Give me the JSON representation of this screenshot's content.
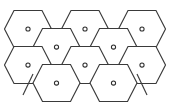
{
  "figure": {
    "background_color": "#ffffff",
    "line_color": "#3a3a3a",
    "node_color": "#2e2e2e",
    "width": 169,
    "height": 102
  },
  "lattice": {
    "cell_shape": "hexagon",
    "orientation": "pointy-side-horizontal",
    "hex_half_width": 23.5,
    "hex_half_height": 18.5,
    "hex_slant": 9.5,
    "row_count": 4,
    "rows": [
      {
        "row_index": 0,
        "offset": "aligned",
        "center_y": 29,
        "cells": [
          {
            "id": "r0c0",
            "cx": 28,
            "cy": 29,
            "marker": "o"
          },
          {
            "id": "r0c1",
            "cx": 85,
            "cy": 29,
            "marker": "o"
          },
          {
            "id": "r0c2",
            "cx": 142,
            "cy": 29,
            "marker": "o"
          }
        ]
      },
      {
        "row_index": 1,
        "offset": "staggered",
        "center_y": 47,
        "cells": [
          {
            "id": "r1c0",
            "cx": 56.5,
            "cy": 47,
            "marker": "o"
          },
          {
            "id": "r1c1",
            "cx": 113.5,
            "cy": 47,
            "marker": "o"
          }
        ]
      },
      {
        "row_index": 2,
        "offset": "aligned",
        "center_y": 65,
        "cells": [
          {
            "id": "r2c0",
            "cx": 28,
            "cy": 65,
            "marker": "o"
          },
          {
            "id": "r2c1",
            "cx": 85,
            "cy": 65,
            "marker": "o"
          },
          {
            "id": "r2c2",
            "cx": 142,
            "cy": 65,
            "marker": "o"
          }
        ]
      },
      {
        "row_index": 3,
        "offset": "staggered",
        "center_y": 83,
        "cells": [
          {
            "id": "r3c0",
            "cx": 56.5,
            "cy": 83,
            "marker": "o"
          },
          {
            "id": "r3c1",
            "cx": 113.5,
            "cy": 83,
            "marker": "o"
          }
        ]
      }
    ],
    "node_marker": {
      "shape": "circle",
      "radius": 2.1,
      "label": "o"
    },
    "edge_stubs": [
      {
        "id": "stub-lower-left",
        "x1": 33.0,
        "y1": 74.0,
        "x2": 23.0,
        "y2": 95.0
      },
      {
        "id": "stub-lower-right",
        "x1": 137.0,
        "y1": 74.0,
        "x2": 147.0,
        "y2": 95.0
      }
    ]
  }
}
